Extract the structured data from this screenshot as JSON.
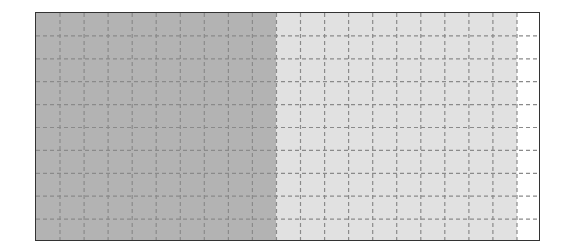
{
  "diagram": {
    "type": "grid-area-model",
    "columns": 21,
    "rows": 10,
    "shaded_dark_columns": 10,
    "shaded_light_columns": 20,
    "colors": {
      "dark": "#b3b3b3",
      "light": "#e1e1e1",
      "empty": "#ffffff",
      "border": "#333333",
      "gridline": "#8a8a8a"
    }
  }
}
